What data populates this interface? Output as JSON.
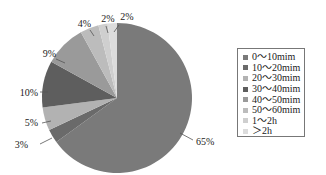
{
  "chart_data": {
    "type": "pie",
    "title": "",
    "categories": [
      "0~10mim",
      "10~20mim",
      "20~30mim",
      "30~40mim",
      "40~50mim",
      "50~60mim",
      "1~2h",
      ">2h"
    ],
    "values": [
      65,
      3,
      5,
      10,
      9,
      4,
      2,
      2
    ],
    "value_labels": [
      "65%",
      "3%",
      "5%",
      "10%",
      "9%",
      "4%",
      "2%",
      "2%"
    ],
    "colors": [
      "#7a7a7a",
      "#6a6a6a",
      "#b2b2b2",
      "#5e5e5e",
      "#9a9a9a",
      "#bcbcbc",
      "#cfcfcf",
      "#dcdcdc"
    ],
    "start_angle": "12 o'clock",
    "direction": "clockwise",
    "legend_position": "right"
  },
  "legend": {
    "items": [
      {
        "label": "0～10mim",
        "color": "#7a7a7a"
      },
      {
        "label": "10～20mim",
        "color": "#6a6a6a"
      },
      {
        "label": "20～30mim",
        "color": "#b2b2b2"
      },
      {
        "label": "30～40mim",
        "color": "#5e5e5e"
      },
      {
        "label": "40～50mim",
        "color": "#9a9a9a"
      },
      {
        "label": "50～60mim",
        "color": "#bcbcbc"
      },
      {
        "label": "1～2h",
        "color": "#cfcfcf"
      },
      {
        "label": "＞2h",
        "color": "#dcdcdc"
      }
    ]
  }
}
